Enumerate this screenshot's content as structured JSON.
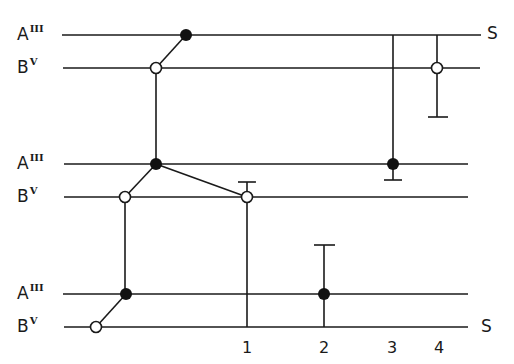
{
  "diagram": {
    "levels": [
      {
        "base": "A",
        "sup": "III",
        "y": 35
      },
      {
        "base": "B",
        "sup": "V",
        "y": 68
      },
      {
        "base": "A",
        "sup": "III",
        "y": 164
      },
      {
        "base": "B",
        "sup": "V",
        "y": 197
      },
      {
        "base": "A",
        "sup": "III",
        "y": 294
      },
      {
        "base": "B",
        "sup": "V",
        "y": 327
      }
    ],
    "end_label_top": "S",
    "end_label_bottom": "S",
    "axis_ticks": [
      "1",
      "2",
      "3",
      "4"
    ]
  }
}
